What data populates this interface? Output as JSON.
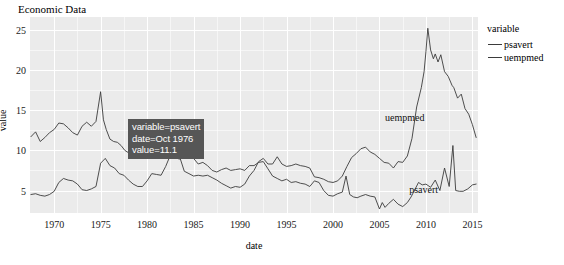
{
  "chart_data": {
    "type": "line",
    "title": "Economic Data",
    "xlabel": "date",
    "ylabel": "value",
    "xlim": [
      1967.4,
      2015.6
    ],
    "ylim": [
      2.2,
      26.6
    ],
    "grid": true,
    "legend_position": "right",
    "legend_title": "variable",
    "x_ticks": [
      "1970",
      "1975",
      "1980",
      "1985",
      "1990",
      "1995",
      "2000",
      "2005",
      "2010",
      "2015"
    ],
    "x_tick_values": [
      1970,
      1975,
      1980,
      1985,
      1990,
      1995,
      2000,
      2005,
      2010,
      2015
    ],
    "y_ticks": [
      "5",
      "10",
      "15",
      "20",
      "25"
    ],
    "y_tick_values": [
      5,
      10,
      15,
      20,
      25
    ],
    "x_minor_values": [
      1972.5,
      1977.5,
      1982.5,
      1987.5,
      1992.5,
      1997.5,
      2002.5,
      2007.5,
      2012.5
    ],
    "y_minor_values": [
      7.5,
      12.5,
      17.5,
      22.5,
      25
    ],
    "series_color": "#3b3b3b",
    "series": [
      {
        "name": "psavert",
        "annotation": "psavert",
        "annotation_at": [
          2008.2,
          5.1
        ],
        "x": [
          1967.5,
          1968.0,
          1968.5,
          1969.0,
          1969.5,
          1970.0,
          1970.5,
          1971.0,
          1971.5,
          1972.0,
          1972.5,
          1973.0,
          1973.5,
          1974.0,
          1974.5,
          1975.0,
          1975.3,
          1975.6,
          1976.0,
          1976.4,
          1976.8,
          1977.2,
          1977.6,
          1978.0,
          1978.5,
          1979.0,
          1979.5,
          1980.0,
          1980.5,
          1981.0,
          1981.5,
          1982.0,
          1982.5,
          1983.0,
          1983.5,
          1984.0,
          1984.5,
          1985.0,
          1985.5,
          1986.0,
          1986.5,
          1987.0,
          1987.5,
          1988.0,
          1988.5,
          1989.0,
          1989.5,
          1990.0,
          1990.5,
          1991.0,
          1991.5,
          1992.0,
          1992.5,
          1993.0,
          1993.5,
          1994.0,
          1994.5,
          1995.0,
          1995.5,
          1996.0,
          1996.5,
          1997.0,
          1997.5,
          1998.0,
          1998.5,
          1999.0,
          1999.5,
          2000.0,
          2000.5,
          2001.0,
          2001.4,
          2001.8,
          2002.2,
          2002.6,
          2003.0,
          2003.5,
          2004.0,
          2004.5,
          2005.0,
          2005.3,
          2005.6,
          2006.0,
          2006.5,
          2007.0,
          2007.5,
          2008.0,
          2008.4,
          2008.8,
          2009.2,
          2009.6,
          2010.0,
          2010.5,
          2011.0,
          2011.5,
          2012.0,
          2012.5,
          2012.9,
          2013.2,
          2013.6,
          2014.0,
          2014.5,
          2015.0,
          2015.4
        ],
        "y": [
          11.7,
          12.3,
          11.1,
          11.6,
          12.2,
          12.6,
          13.4,
          13.3,
          12.8,
          12.2,
          11.9,
          13.0,
          13.5,
          13.0,
          13.6,
          17.3,
          13.8,
          12.6,
          11.4,
          11.1,
          11.0,
          10.6,
          10.0,
          9.7,
          9.5,
          9.3,
          9.6,
          10.0,
          10.6,
          10.9,
          11.4,
          11.2,
          10.9,
          9.1,
          8.9,
          10.3,
          10.1,
          9.0,
          8.3,
          8.5,
          8.1,
          7.5,
          7.3,
          7.6,
          7.8,
          7.5,
          7.6,
          7.7,
          7.5,
          8.1,
          8.1,
          8.5,
          8.6,
          7.7,
          6.8,
          6.5,
          6.2,
          6.4,
          6.0,
          6.1,
          5.9,
          5.8,
          5.5,
          6.2,
          6.0,
          5.0,
          4.4,
          4.3,
          4.6,
          4.8,
          6.8,
          4.5,
          4.2,
          4.1,
          4.3,
          4.5,
          4.3,
          4.2,
          2.7,
          3.5,
          2.9,
          3.4,
          3.9,
          3.3,
          3.0,
          3.5,
          4.2,
          5.1,
          6.0,
          5.7,
          5.8,
          5.4,
          6.3,
          5.0,
          7.8,
          5.5,
          10.6,
          5.0,
          4.9,
          4.9,
          5.2,
          5.7,
          5.8
        ]
      },
      {
        "name": "uempmed",
        "annotation": "uempmed",
        "annotation_at": [
          2005.6,
          14.0
        ],
        "x": [
          1967.5,
          1968.0,
          1968.5,
          1969.0,
          1969.5,
          1970.0,
          1970.5,
          1971.0,
          1971.5,
          1972.0,
          1972.5,
          1973.0,
          1973.5,
          1974.0,
          1974.5,
          1975.0,
          1975.5,
          1976.0,
          1976.5,
          1977.0,
          1977.5,
          1978.0,
          1978.5,
          1979.0,
          1979.5,
          1980.0,
          1980.5,
          1981.0,
          1981.5,
          1982.0,
          1982.5,
          1983.0,
          1983.5,
          1984.0,
          1984.5,
          1985.0,
          1985.5,
          1986.0,
          1986.5,
          1987.0,
          1987.5,
          1988.0,
          1988.5,
          1989.0,
          1989.5,
          1990.0,
          1990.5,
          1991.0,
          1991.5,
          1992.0,
          1992.5,
          1993.0,
          1993.5,
          1994.0,
          1994.5,
          1995.0,
          1995.5,
          1996.0,
          1996.5,
          1997.0,
          1997.5,
          1998.0,
          1998.5,
          1999.0,
          1999.5,
          2000.0,
          2000.5,
          2001.0,
          2001.5,
          2002.0,
          2002.5,
          2003.0,
          2003.5,
          2004.0,
          2004.5,
          2005.0,
          2005.5,
          2006.0,
          2006.5,
          2007.0,
          2007.5,
          2008.0,
          2008.5,
          2009.0,
          2009.5,
          2009.8,
          2010.0,
          2010.2,
          2010.5,
          2010.8,
          2011.0,
          2011.3,
          2011.6,
          2012.0,
          2012.4,
          2012.8,
          2013.0,
          2013.4,
          2013.8,
          2014.2,
          2014.6,
          2015.0,
          2015.4
        ],
        "y": [
          4.5,
          4.6,
          4.4,
          4.3,
          4.5,
          4.9,
          6.0,
          6.5,
          6.3,
          6.2,
          5.8,
          5.1,
          5.0,
          5.2,
          5.5,
          8.4,
          9.0,
          8.1,
          7.8,
          7.1,
          6.9,
          6.3,
          5.8,
          5.5,
          5.5,
          6.2,
          7.1,
          7.0,
          6.9,
          8.0,
          9.4,
          10.1,
          9.2,
          7.4,
          7.1,
          6.8,
          6.9,
          6.8,
          6.9,
          6.6,
          6.3,
          5.9,
          5.6,
          5.3,
          5.5,
          5.4,
          5.8,
          6.8,
          7.5,
          8.6,
          9.0,
          8.3,
          8.3,
          9.2,
          8.3,
          8.0,
          8.1,
          8.3,
          8.1,
          8.0,
          7.8,
          6.7,
          6.6,
          6.4,
          6.1,
          6.0,
          6.2,
          6.8,
          8.0,
          9.1,
          9.6,
          10.2,
          10.4,
          9.8,
          9.5,
          9.0,
          8.5,
          8.4,
          7.8,
          8.6,
          8.5,
          9.3,
          11.5,
          15.4,
          17.8,
          19.8,
          22.3,
          25.2,
          22.5,
          21.4,
          22.0,
          21.0,
          21.9,
          19.8,
          19.2,
          18.1,
          17.8,
          16.5,
          17.0,
          15.2,
          14.5,
          13.2,
          11.6
        ]
      }
    ]
  },
  "tooltip": {
    "line1": "variable=psavert",
    "line2": "date=Oct 1976",
    "line3": "value=11.1",
    "background": "#565656",
    "text_color": "#ffffff"
  },
  "legend": {
    "title": "variable",
    "items": [
      {
        "label": "psavert",
        "color": "#3b3b3b"
      },
      {
        "label": "uempmed",
        "color": "#3b3b3b"
      }
    ]
  },
  "panel": {
    "background": "#ebebeb",
    "gridline_color": "#ffffff"
  }
}
